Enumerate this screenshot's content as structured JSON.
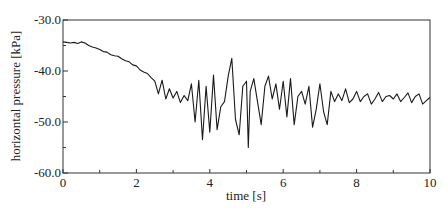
{
  "chart_data": {
    "type": "line",
    "title": "",
    "xlabel": "time [s]",
    "ylabel": "horizontal pressure [kPa]",
    "xlim": [
      0,
      10
    ],
    "ylim": [
      -60,
      -30
    ],
    "x_ticks": [
      0,
      2,
      4,
      6,
      8,
      10
    ],
    "x_tick_labels": [
      "0",
      "2",
      "4",
      "6",
      "8",
      "10"
    ],
    "x_minor_ticks": [
      1,
      3,
      5,
      7,
      9
    ],
    "y_ticks": [
      -30,
      -40,
      -50,
      -60
    ],
    "y_tick_labels": [
      "-30.0",
      "-40.0",
      "-50.0",
      "-60.0"
    ],
    "y_minor_ticks": [
      -35,
      -45,
      -55
    ],
    "grid": false,
    "legend": null,
    "line_color": "#1a1a1a",
    "series": [
      {
        "name": "horizontal pressure",
        "x": [
          0.0,
          0.1,
          0.2,
          0.3,
          0.4,
          0.5,
          0.6,
          0.7,
          0.8,
          0.9,
          1.0,
          1.1,
          1.2,
          1.3,
          1.4,
          1.5,
          1.6,
          1.7,
          1.8,
          1.9,
          2.0,
          2.1,
          2.2,
          2.3,
          2.4,
          2.5,
          2.6,
          2.7,
          2.8,
          2.9,
          3.0,
          3.1,
          3.2,
          3.3,
          3.4,
          3.5,
          3.6,
          3.7,
          3.8,
          3.9,
          4.0,
          4.1,
          4.2,
          4.3,
          4.4,
          4.5,
          4.6,
          4.7,
          4.8,
          4.9,
          5.0,
          5.05,
          5.1,
          5.2,
          5.3,
          5.4,
          5.5,
          5.6,
          5.7,
          5.8,
          5.9,
          6.0,
          6.1,
          6.2,
          6.3,
          6.4,
          6.5,
          6.6,
          6.7,
          6.8,
          6.9,
          7.0,
          7.1,
          7.2,
          7.3,
          7.4,
          7.5,
          7.6,
          7.7,
          7.8,
          7.9,
          8.0,
          8.1,
          8.2,
          8.3,
          8.4,
          8.5,
          8.6,
          8.7,
          8.8,
          8.9,
          9.0,
          9.1,
          9.2,
          9.3,
          9.4,
          9.5,
          9.6,
          9.7,
          9.8,
          9.9,
          10.0
        ],
        "values": [
          -34.3,
          -34.4,
          -34.5,
          -34.4,
          -34.6,
          -34.3,
          -34.5,
          -35.0,
          -35.3,
          -35.5,
          -35.8,
          -36.2,
          -36.3,
          -36.8,
          -37.0,
          -37.1,
          -37.6,
          -38.0,
          -38.2,
          -38.8,
          -39.0,
          -39.8,
          -40.2,
          -40.5,
          -41.3,
          -42.0,
          -44.5,
          -41.8,
          -45.5,
          -43.5,
          -45.3,
          -44.0,
          -46.2,
          -44.8,
          -45.8,
          -42.5,
          -50.0,
          -41.8,
          -53.5,
          -43.0,
          -52.0,
          -40.8,
          -51.5,
          -47.0,
          -46.0,
          -41.0,
          -37.5,
          -49.5,
          -52.5,
          -43.0,
          -42.0,
          -55.0,
          -44.0,
          -41.5,
          -46.0,
          -50.5,
          -43.0,
          -41.0,
          -45.5,
          -42.5,
          -47.5,
          -42.0,
          -49.0,
          -41.5,
          -50.5,
          -45.0,
          -44.0,
          -46.5,
          -43.0,
          -51.0,
          -47.5,
          -42.5,
          -48.0,
          -50.5,
          -44.0,
          -46.0,
          -44.5,
          -45.8,
          -43.5,
          -46.2,
          -45.5,
          -44.0,
          -46.0,
          -45.0,
          -44.5,
          -46.5,
          -45.5,
          -44.2,
          -46.0,
          -45.0,
          -44.8,
          -45.5,
          -44.5,
          -46.0,
          -45.2,
          -44.3,
          -46.2,
          -45.0,
          -44.5,
          -46.5,
          -45.8,
          -45.2
        ]
      }
    ]
  }
}
